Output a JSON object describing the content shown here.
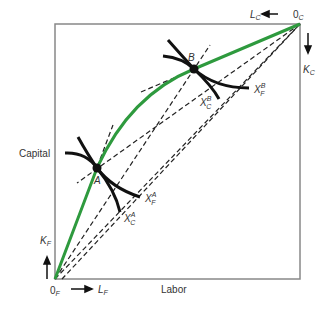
{
  "diagram": {
    "type": "edgeworth-box-production",
    "colors": {
      "box": "#888888",
      "contract_curve": "#2e9a3e",
      "isoquant": "#111111",
      "dashed": "#222222",
      "text": "#333333"
    },
    "axes": {
      "vertical_label": "Capital",
      "horizontal_label": "Labor"
    },
    "origins": {
      "food": {
        "zero": "0",
        "sub": "F",
        "labor": "L",
        "labor_sub": "F",
        "capital": "K",
        "capital_sub": "F"
      },
      "cloth": {
        "zero": "0",
        "sub": "C",
        "labor": "L",
        "labor_sub": "C",
        "capital": "K",
        "capital_sub": "C"
      }
    },
    "points": [
      {
        "label": "A"
      },
      {
        "label": "B"
      }
    ],
    "isoquants": [
      {
        "base": "X",
        "sub": "F",
        "sup": "A"
      },
      {
        "base": "X",
        "sub": "C",
        "sup": "A"
      },
      {
        "base": "X",
        "sub": "F",
        "sup": "B"
      },
      {
        "base": "X",
        "sub": "C",
        "sup": "B"
      }
    ]
  }
}
